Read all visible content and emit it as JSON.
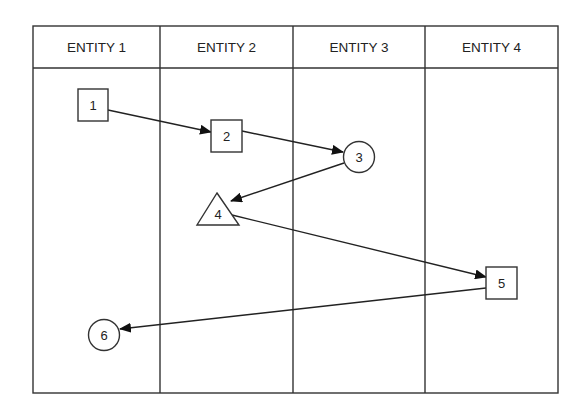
{
  "diagram": {
    "type": "swimlane-sequence",
    "lanes": [
      {
        "label": "ENTITY 1"
      },
      {
        "label": "ENTITY 2"
      },
      {
        "label": "ENTITY 3"
      },
      {
        "label": "ENTITY 4"
      }
    ],
    "nodes": [
      {
        "id": "1",
        "label": "1",
        "shape": "square",
        "lane": 1
      },
      {
        "id": "2",
        "label": "2",
        "shape": "square",
        "lane": 2
      },
      {
        "id": "3",
        "label": "3",
        "shape": "circle",
        "lane": 3
      },
      {
        "id": "4",
        "label": "4",
        "shape": "triangle",
        "lane": 2
      },
      {
        "id": "5",
        "label": "5",
        "shape": "square",
        "lane": 4
      },
      {
        "id": "6",
        "label": "6",
        "shape": "circle",
        "lane": 1
      }
    ],
    "edges": [
      {
        "from": "1",
        "to": "2"
      },
      {
        "from": "2",
        "to": "3"
      },
      {
        "from": "3",
        "to": "4"
      },
      {
        "from": "4",
        "to": "5"
      },
      {
        "from": "5",
        "to": "6"
      }
    ],
    "colors": {
      "stroke": "#333333",
      "background": "#ffffff",
      "text": "#222222"
    }
  }
}
